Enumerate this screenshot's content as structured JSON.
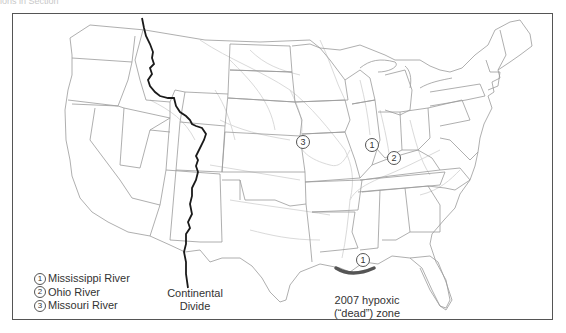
{
  "caption_fragment": "ions in Section",
  "map": {
    "title": "",
    "colors": {
      "state_border": "#9a9a9a",
      "river": "#d8d8d8",
      "continental_divide": "#1a1a1a",
      "hypoxic_zone": "#555555",
      "frame": "#555555"
    },
    "markers": [
      {
        "id": "1",
        "river": "Mississippi River",
        "x": 369,
        "y": 142
      },
      {
        "id": "2",
        "river": "Ohio River",
        "x": 390,
        "y": 155
      },
      {
        "id": "3",
        "river": "Missouri River",
        "x": 300,
        "y": 139
      },
      {
        "id": "1",
        "river": "Mississippi River",
        "x": 327,
        "y": 256
      }
    ],
    "continental_divide_label_line1": "Continental",
    "continental_divide_label_line2": "Divide",
    "hypoxic_label_line1": "2007 hypoxic",
    "hypoxic_label_line2": "(“dead”) zone"
  },
  "legend": {
    "items": [
      {
        "num": "1",
        "label": "Mississippi River"
      },
      {
        "num": "2",
        "label": "Ohio River"
      },
      {
        "num": "3",
        "label": "Missouri River"
      }
    ]
  }
}
